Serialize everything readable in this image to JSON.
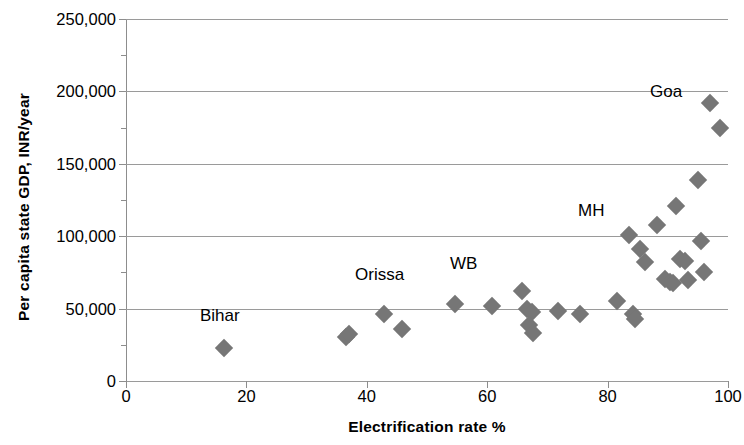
{
  "chart_data": {
    "type": "scatter",
    "title": "",
    "xlabel": "Electrification rate %",
    "ylabel": "Per capita state GDP, INR/year",
    "xlim": [
      0,
      100
    ],
    "ylim": [
      0,
      250000
    ],
    "xticks": [
      "0",
      "20",
      "40",
      "60",
      "80",
      "100"
    ],
    "xtick_values": [
      0,
      20,
      40,
      60,
      80,
      100
    ],
    "yticks": [
      "0",
      "50,000",
      "100,000",
      "150,000",
      "200,000",
      "250,000"
    ],
    "ytick_values": [
      0,
      50000,
      100000,
      150000,
      200000,
      250000
    ],
    "grid": "horizontal",
    "legend": "none",
    "marker": "diamond",
    "marker_color": "#767676",
    "points": [
      {
        "x": 16.3,
        "y": 23000
      },
      {
        "x": 36.6,
        "y": 30500
      },
      {
        "x": 37.0,
        "y": 32500
      },
      {
        "x": 42.8,
        "y": 46500
      },
      {
        "x": 45.8,
        "y": 36000
      },
      {
        "x": 54.7,
        "y": 53500
      },
      {
        "x": 60.8,
        "y": 52000
      },
      {
        "x": 65.8,
        "y": 62000
      },
      {
        "x": 66.6,
        "y": 49500
      },
      {
        "x": 67.4,
        "y": 47500
      },
      {
        "x": 67.0,
        "y": 38500
      },
      {
        "x": 67.6,
        "y": 33000
      },
      {
        "x": 71.8,
        "y": 48000
      },
      {
        "x": 75.4,
        "y": 46000
      },
      {
        "x": 81.5,
        "y": 55500
      },
      {
        "x": 83.6,
        "y": 100500
      },
      {
        "x": 84.2,
        "y": 46500
      },
      {
        "x": 84.6,
        "y": 43000
      },
      {
        "x": 85.3,
        "y": 91500
      },
      {
        "x": 86.2,
        "y": 82000
      },
      {
        "x": 88.2,
        "y": 108000
      },
      {
        "x": 89.5,
        "y": 70500
      },
      {
        "x": 90.3,
        "y": 68500
      },
      {
        "x": 90.8,
        "y": 67500
      },
      {
        "x": 91.3,
        "y": 121000
      },
      {
        "x": 92.0,
        "y": 84500
      },
      {
        "x": 92.8,
        "y": 83000
      },
      {
        "x": 93.3,
        "y": 70000
      },
      {
        "x": 95.0,
        "y": 139000
      },
      {
        "x": 95.5,
        "y": 96500
      },
      {
        "x": 96.0,
        "y": 75000
      },
      {
        "x": 97.0,
        "y": 192000
      },
      {
        "x": 98.6,
        "y": 175000
      }
    ],
    "annotations": [
      {
        "label": "Bihar",
        "x_px": 200,
        "y_px": 307
      },
      {
        "label": "Orissa",
        "x_px": 355,
        "y_px": 266
      },
      {
        "label": "WB",
        "x_px": 450,
        "y_px": 255
      },
      {
        "label": "MH",
        "x_px": 578,
        "y_px": 202
      },
      {
        "label": "Goa",
        "x_px": 650,
        "y_px": 83
      }
    ]
  }
}
